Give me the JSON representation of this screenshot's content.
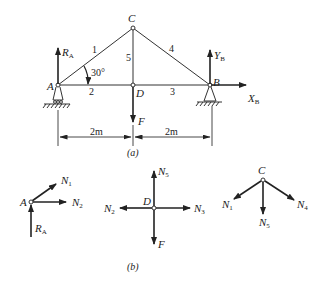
{
  "figure_a": {
    "caption": "(a)",
    "nodes": {
      "A": "A",
      "B": "B",
      "C": "C",
      "D": "D"
    },
    "members": [
      "1",
      "2",
      "3",
      "4",
      "5"
    ],
    "angle_label": "30°",
    "forces": {
      "RA": {
        "main": "R",
        "sub": "A"
      },
      "YB": {
        "main": "Y",
        "sub": "B"
      },
      "XB": {
        "main": "X",
        "sub": "B"
      },
      "F": "F"
    },
    "dimensions": [
      "2m",
      "2m"
    ]
  },
  "figure_b": {
    "caption": "(b)",
    "node_A": {
      "label": "A",
      "forces": [
        {
          "main": "N",
          "sub": "1"
        },
        {
          "main": "N",
          "sub": "2"
        },
        {
          "main": "R",
          "sub": "A"
        }
      ]
    },
    "node_D": {
      "label": "D",
      "forces": [
        {
          "main": "N",
          "sub": "5"
        },
        {
          "main": "N",
          "sub": "2"
        },
        {
          "main": "N",
          "sub": "3"
        },
        {
          "main": "F",
          "sub": ""
        }
      ]
    },
    "node_C": {
      "label": "C",
      "forces": [
        {
          "main": "N",
          "sub": "1"
        },
        {
          "main": "N",
          "sub": "5"
        },
        {
          "main": "N",
          "sub": "4"
        }
      ]
    }
  },
  "colors": {
    "line": "#333333",
    "arrow": "#222222"
  }
}
